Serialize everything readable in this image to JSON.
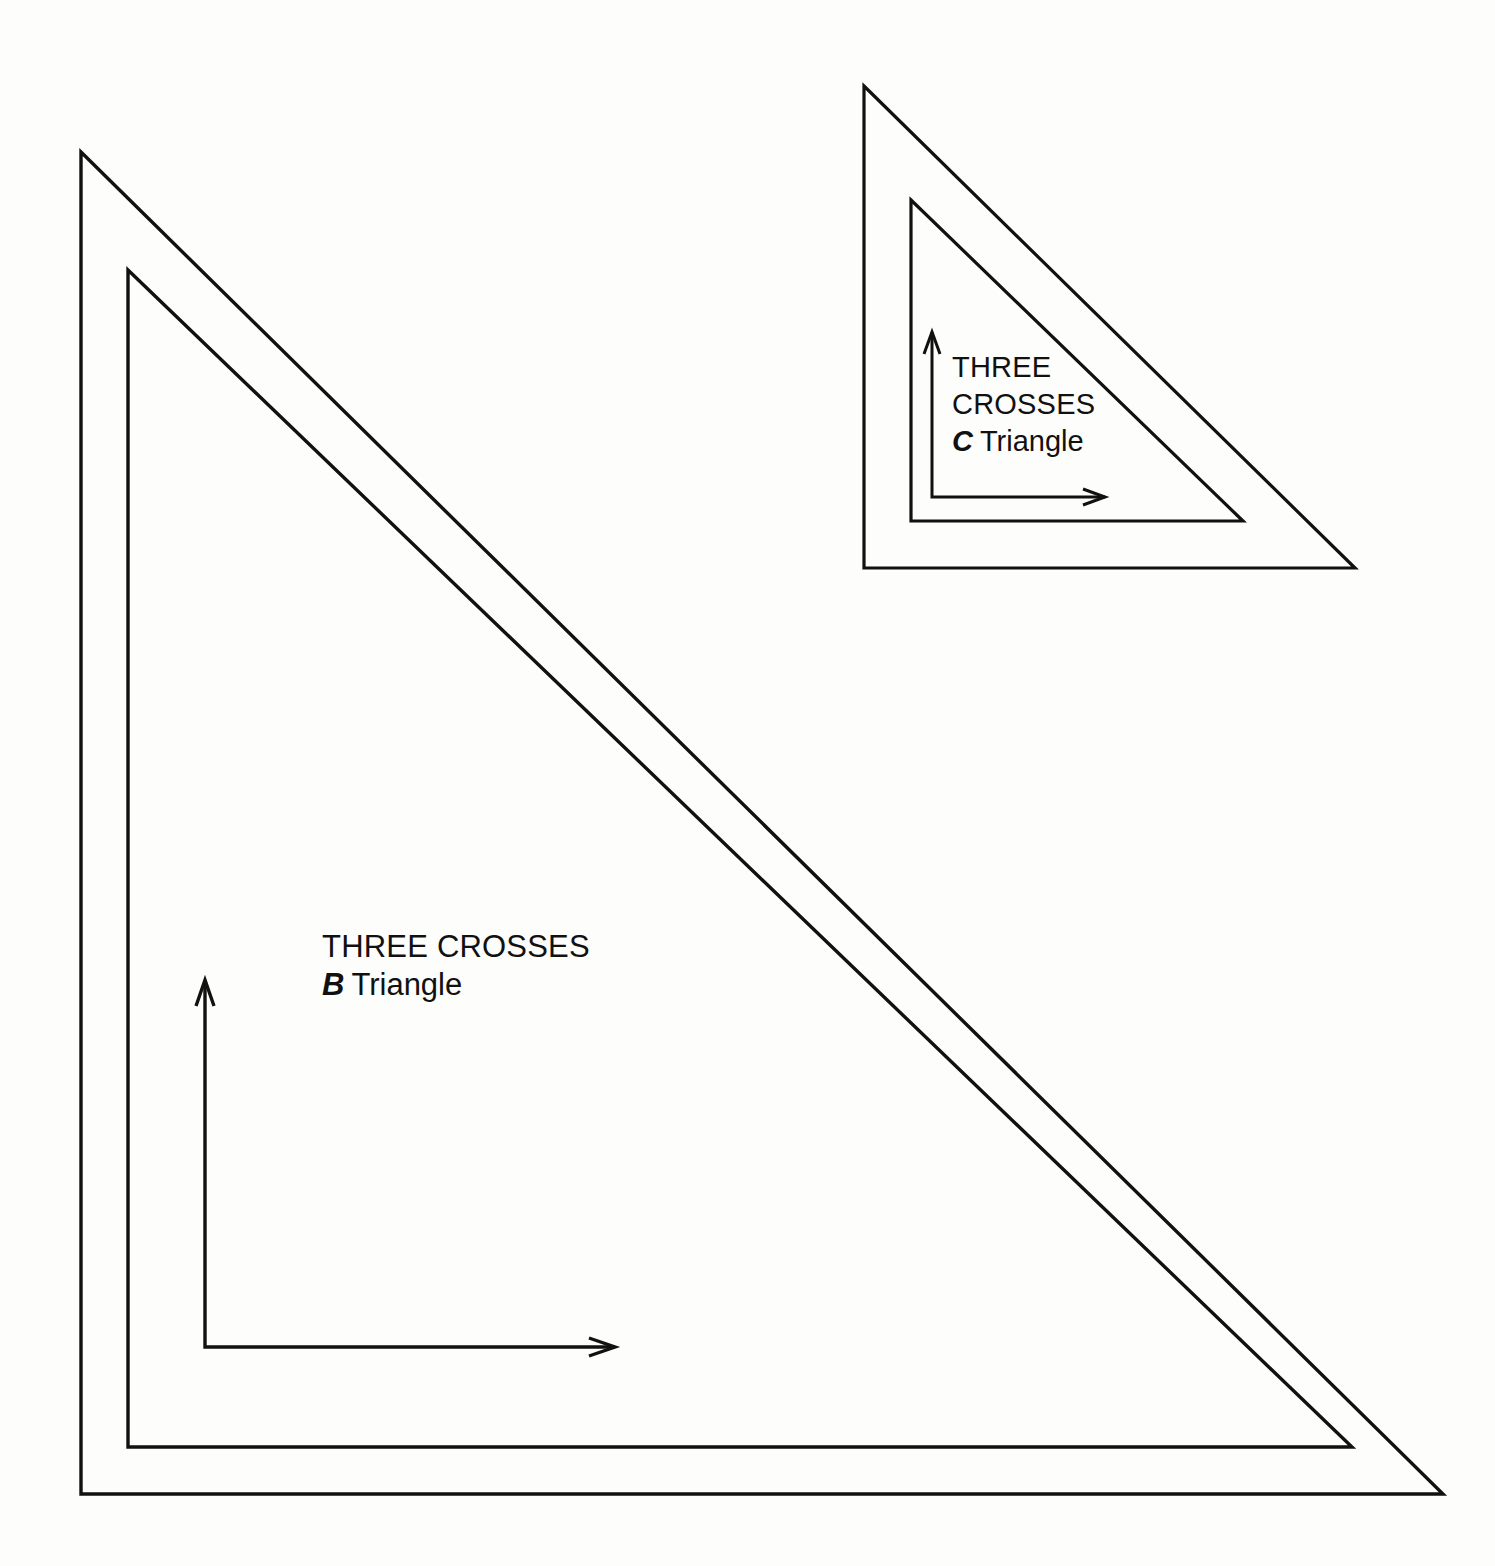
{
  "sheet": {
    "width": 1495,
    "height": 1566,
    "background_color": "#fdfdfc",
    "ink_color": "#111111",
    "description": "Technical line drawing of two hollow 45-degree drafting set squares"
  },
  "items": [
    {
      "id": "triangle-b",
      "name": "B Triangle",
      "brand": "THREE CROSSES",
      "model_letter": "B",
      "model_word": "Triangle",
      "label_lines": [
        "THREE CROSSES"
      ],
      "label_x": 322,
      "label_y": 957,
      "label_line_height": 38,
      "label_font_size": 31,
      "outer": {
        "apex_x": 81,
        "apex_y": 152,
        "corner_x": 81,
        "corner_y": 1494,
        "end_x": 1443,
        "end_y": 1494
      },
      "inner": {
        "apex_x": 128,
        "apex_y": 270,
        "corner_x": 128,
        "corner_y": 1447,
        "end_x": 1352,
        "end_y": 1447
      },
      "stroke_width": 3.4,
      "axis": {
        "corner_x": 205,
        "corner_y": 1347,
        "up_tip_y": 980,
        "right_tip_x": 615,
        "shaft_width": 3.4,
        "head_length": 26,
        "head_half_width": 9
      }
    },
    {
      "id": "triangle-c",
      "name": "C Triangle",
      "brand": "THREE CROSSES",
      "model_letter": "C",
      "model_word": "Triangle",
      "label_lines": [
        "THREE",
        "CROSSES"
      ],
      "label_x": 952,
      "label_y": 377,
      "label_line_height": 37,
      "label_font_size": 29,
      "outer": {
        "apex_x": 864,
        "apex_y": 86,
        "corner_x": 864,
        "corner_y": 568,
        "end_x": 1355,
        "end_y": 568
      },
      "inner": {
        "apex_x": 911,
        "apex_y": 200,
        "corner_x": 911,
        "corner_y": 521,
        "end_x": 1243,
        "end_y": 521
      },
      "stroke_width": 3.2,
      "axis": {
        "corner_x": 932,
        "corner_y": 497,
        "up_tip_y": 332,
        "right_tip_x": 1105,
        "shaft_width": 3.0,
        "head_length": 22,
        "head_half_width": 8
      }
    }
  ]
}
